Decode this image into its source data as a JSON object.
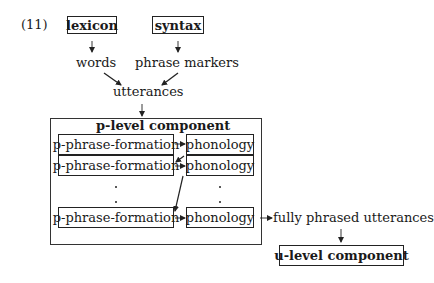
{
  "example_number": "(11)",
  "top": {
    "lexicon": "lexicon",
    "syntax": "syntax",
    "words": "words",
    "phrase_markers": "phrase markers",
    "utterances": "utterances"
  },
  "p_level": {
    "title": "p-level component",
    "rows": [
      {
        "left": "p-phrase-formation",
        "right": "phonology"
      },
      {
        "left": "p-phrase-formation",
        "right": "phonology"
      },
      {
        "left": "p-phrase-formation",
        "right": "phonology"
      }
    ],
    "ellipsis": "⋮"
  },
  "output": {
    "fully_phrased": "fully phrased utterances",
    "u_level": "u-level component"
  }
}
